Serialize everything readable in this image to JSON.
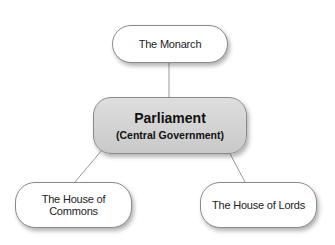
{
  "diagram": {
    "top": {
      "label": "The Monarch"
    },
    "center": {
      "title": "Parliament",
      "subtitle": "(Central Government)"
    },
    "left": {
      "label": "The House of Commons"
    },
    "right": {
      "label": "The House of Lords"
    },
    "colors": {
      "node_border": "#8a8a8a",
      "center_fill": "#d4d4d4",
      "line": "#999999"
    }
  }
}
